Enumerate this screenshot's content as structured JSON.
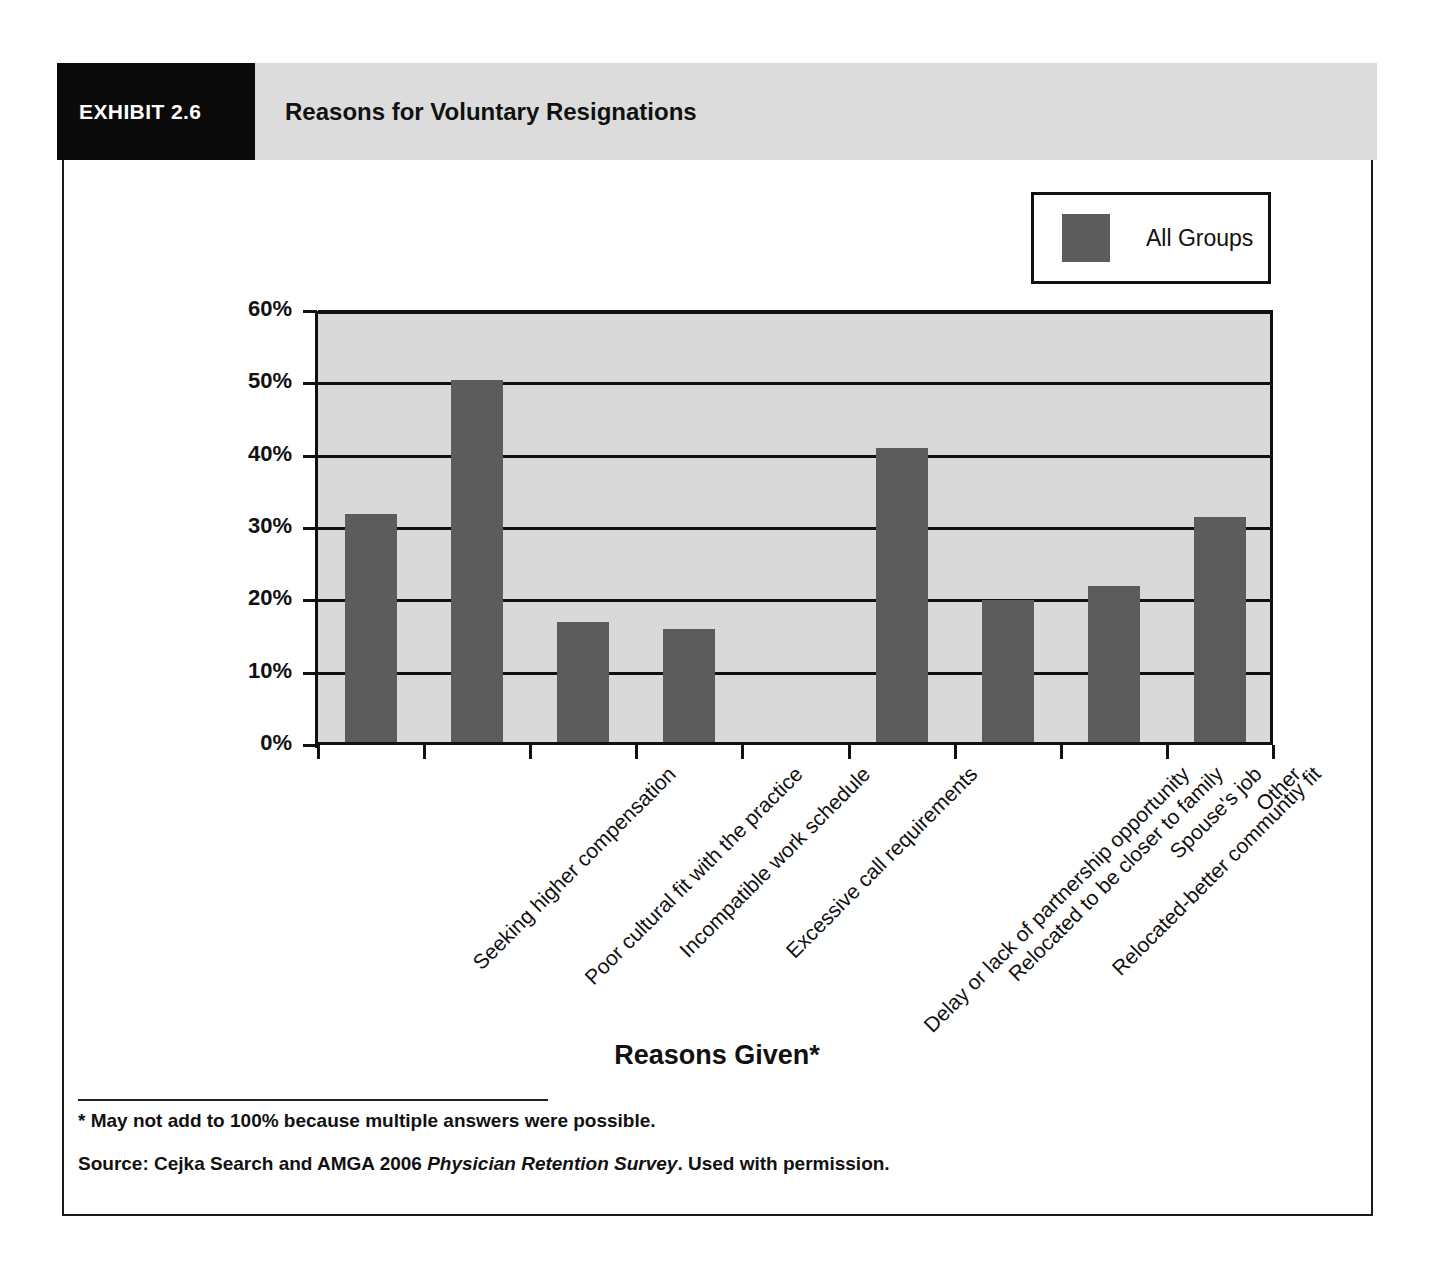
{
  "exhibit": {
    "number_label": "EXHIBIT 2.6",
    "title": "Reasons for Voluntary Resignations"
  },
  "legend": {
    "position": "top-right",
    "series_label": "All Groups",
    "swatch_color": "#5c5c5c"
  },
  "footnotes": {
    "asterisk_note": "* May not add to 100% because multiple answers were possible.",
    "source_prefix": "Source: Cejka Search and AMGA 2006 ",
    "source_italic": "Physician Retention Survey",
    "source_suffix": ". Used with permission."
  },
  "colors": {
    "bar_fill": "#5c5c5c",
    "plot_background": "#d9d9d9",
    "axis": "#111111",
    "header_box": "#0a0a0a",
    "header_banner": "#dcdcdc"
  },
  "chart_data": {
    "type": "bar",
    "title": "Reasons for Voluntary Resignations",
    "xlabel": "Reasons Given*",
    "ylabel": "",
    "ylim": [
      0,
      60
    ],
    "ytick_values": [
      0,
      10,
      20,
      30,
      40,
      50,
      60
    ],
    "ytick_labels": [
      "0%",
      "10%",
      "20%",
      "30%",
      "40%",
      "50%",
      "60%"
    ],
    "grid": true,
    "legend_position": "top-right",
    "categories": [
      "Seeking higher compensation",
      "Poor cultural fit with the practice",
      "Incompatible work schedule",
      "Excessive call requirements",
      "Delay or lack of partnership opportunity",
      "Relocated to be closer to family",
      "Relocated-better communtiy fit",
      "Spouse's job",
      "Other"
    ],
    "series": [
      {
        "name": "All Groups",
        "values": [
          32,
          50.5,
          17,
          16,
          0,
          41,
          20,
          22,
          31.5
        ]
      }
    ]
  }
}
